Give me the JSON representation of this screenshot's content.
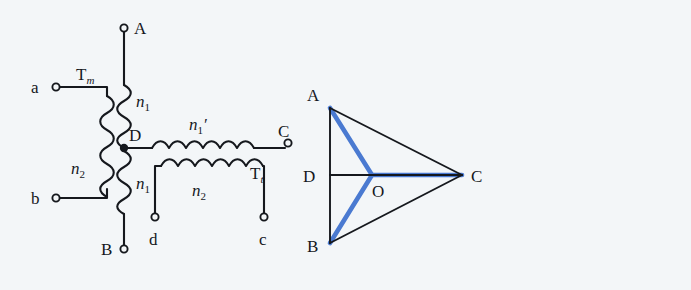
{
  "figure": {
    "background_color": "#f3f6f8",
    "line_color": "#15181d",
    "accent_color": "#4a7ad1"
  },
  "circuit": {
    "name": "scott-connection-circuit",
    "terminals": [
      {
        "id": "A",
        "label": "A",
        "x": 124,
        "y": 28,
        "label_x": 134,
        "label_y": 33
      },
      {
        "id": "a",
        "label": "a",
        "x": 56,
        "y": 87,
        "label_x": 36,
        "label_y": 93
      },
      {
        "id": "b",
        "label": "b",
        "x": 56,
        "y": 198,
        "label_x": 36,
        "label_y": 204
      },
      {
        "id": "B",
        "label": "B",
        "x": 124,
        "y": 249,
        "label_x": 103,
        "label_y": 254
      },
      {
        "id": "d",
        "label": "d",
        "x": 155,
        "y": 217,
        "label_x": 148,
        "label_y": 244
      },
      {
        "id": "c",
        "label": "c",
        "x": 264,
        "y": 217,
        "label_x": 258,
        "label_y": 244
      },
      {
        "id": "C",
        "label": "C",
        "x": 288,
        "y": 143,
        "label_x": 281,
        "label_y": 135
      },
      {
        "id": "D",
        "label": "D",
        "x": 124,
        "y": 148,
        "label_x": 129,
        "label_y": 137
      }
    ],
    "coil_labels": [
      {
        "id": "Tm",
        "base": "T",
        "subscript": "m",
        "x": 84,
        "y": 80,
        "italic_sub": true
      },
      {
        "id": "n1_top",
        "base": "n",
        "subscript": "1",
        "x": 140,
        "y": 105,
        "italic_sub": false
      },
      {
        "id": "n2_left",
        "base": "n",
        "subscript": "2",
        "x": 78,
        "y": 172,
        "italic_sub": false
      },
      {
        "id": "n1_bottom",
        "base": "n",
        "subscript": "1",
        "x": 140,
        "y": 187,
        "italic_sub": false
      },
      {
        "id": "n1_prime",
        "base": "n",
        "subscript": "1",
        "prime": "′",
        "x": 194,
        "y": 128,
        "italic_sub": false
      },
      {
        "id": "n2_bottom",
        "base": "n",
        "subscript": "2",
        "x": 198,
        "y": 194,
        "italic_sub": false
      },
      {
        "id": "Tt",
        "base": "T",
        "subscript": "t",
        "x": 257,
        "y": 176,
        "italic_sub": true
      }
    ]
  },
  "phasor": {
    "name": "phasor-triangle",
    "vertices": [
      {
        "id": "A",
        "label": "A",
        "x": 330,
        "y": 108,
        "label_x": 311,
        "label_y": 96
      },
      {
        "id": "B",
        "label": "B",
        "x": 330,
        "y": 243,
        "label_x": 311,
        "label_y": 252
      },
      {
        "id": "C",
        "label": "C",
        "x": 462,
        "y": 175,
        "label_x": 473,
        "label_y": 181
      },
      {
        "id": "D",
        "label": "D",
        "x": 330,
        "y": 175,
        "label_x": 306,
        "label_y": 181
      },
      {
        "id": "O",
        "label": "O",
        "x": 372,
        "y": 175,
        "label_x": 377,
        "label_y": 194
      }
    ],
    "black_edges": [
      {
        "id": "edge-AB",
        "from": "A",
        "to": "B"
      },
      {
        "id": "edge-AC",
        "from": "A",
        "to": "C"
      },
      {
        "id": "edge-BC",
        "from": "B",
        "to": "C"
      },
      {
        "id": "edge-DC",
        "from": "D",
        "to": "C"
      }
    ],
    "blue_edges": [
      {
        "id": "star-OA",
        "from": "O",
        "to": "A"
      },
      {
        "id": "star-OB",
        "from": "O",
        "to": "B"
      },
      {
        "id": "star-OC",
        "from": "O",
        "to": "C"
      }
    ]
  }
}
